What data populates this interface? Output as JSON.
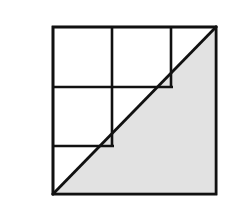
{
  "figure": {
    "label": "C",
    "label_color": "#848484",
    "canvas": {
      "width": 234,
      "height": 221,
      "background": "#ffffff"
    },
    "square": {
      "x": 53,
      "y": 27,
      "width": 163,
      "height": 167,
      "stroke": "#111111",
      "stroke_width": 2.6,
      "fill": "#ffffff"
    },
    "shaded_triangle": {
      "name": "lower-right-triangle",
      "points": "53,194 216,194 216,27",
      "fill": "#e2e2e2",
      "stroke": "#111111",
      "stroke_width": 2.6
    },
    "diagonal": {
      "x1": 53,
      "y1": 194,
      "x2": 216,
      "y2": 27,
      "stroke": "#111111",
      "stroke_width": 2.8
    },
    "grid_lines": [
      {
        "name": "vertical-line-1",
        "x1": 112,
        "y1": 27,
        "x2": 112,
        "y2": 146
      },
      {
        "name": "vertical-line-2",
        "x1": 171,
        "y1": 27,
        "x2": 171,
        "y2": 87
      },
      {
        "name": "horizontal-line-1",
        "x1": 53,
        "y1": 87,
        "x2": 173,
        "y2": 87
      },
      {
        "name": "horizontal-line-2",
        "x1": 53,
        "y1": 146,
        "x2": 114,
        "y2": 146
      }
    ],
    "grid_stroke": "#111111",
    "grid_stroke_width": 2.6
  }
}
